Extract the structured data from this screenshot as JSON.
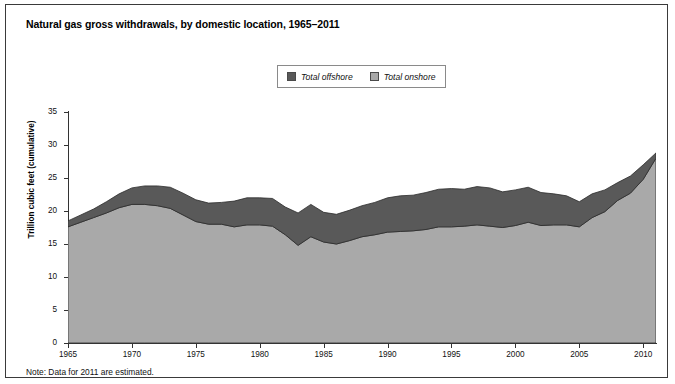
{
  "figure": {
    "title": "Natural gas gross withdrawals, by domestic location, 1965–2011",
    "note": "Note: Data for 2011 are estimated."
  },
  "legend": {
    "items": [
      {
        "label": "Total offshore",
        "color": "#595959",
        "swatch_name": "legend-swatch-offshore"
      },
      {
        "label": "Total onshore",
        "color": "#a9a9a9",
        "swatch_name": "legend-swatch-onshore"
      }
    ]
  },
  "axes": {
    "ylabel": "Trillion cubic feet (cumulative)",
    "yticks": [
      "0",
      "5",
      "10",
      "15",
      "20",
      "25",
      "30",
      "35"
    ],
    "xticks": [
      "1965",
      "1970",
      "1975",
      "1980",
      "1985",
      "1990",
      "1995",
      "2000",
      "2005",
      "2010"
    ]
  },
  "chart_data": {
    "type": "area",
    "stacked": true,
    "title": "Natural gas gross withdrawals, by domestic location, 1965–2011",
    "xlabel": "",
    "ylabel": "Trillion cubic feet (cumulative)",
    "xlim": [
      1965,
      2011
    ],
    "ylim": [
      0,
      35
    ],
    "ytick_step": 5,
    "xtick_step": 5,
    "grid": false,
    "legend_position": "top-center",
    "annotations": [
      "Note: Data for 2011 are estimated."
    ],
    "x": [
      1965,
      1966,
      1967,
      1968,
      1969,
      1970,
      1971,
      1972,
      1973,
      1974,
      1975,
      1976,
      1977,
      1978,
      1979,
      1980,
      1981,
      1982,
      1983,
      1984,
      1985,
      1986,
      1987,
      1988,
      1989,
      1990,
      1991,
      1992,
      1993,
      1994,
      1995,
      1996,
      1997,
      1998,
      1999,
      2000,
      2001,
      2002,
      2003,
      2004,
      2005,
      2006,
      2007,
      2008,
      2009,
      2010,
      2011
    ],
    "series": [
      {
        "name": "Total onshore",
        "color": "#a9a9a9",
        "values": [
          17.6,
          18.3,
          19.0,
          19.7,
          20.5,
          21.0,
          21.0,
          20.8,
          20.4,
          19.4,
          18.4,
          18.0,
          18.0,
          17.6,
          17.9,
          17.9,
          17.7,
          16.4,
          14.8,
          16.1,
          15.3,
          15.0,
          15.5,
          16.1,
          16.4,
          16.8,
          16.9,
          17.0,
          17.2,
          17.6,
          17.6,
          17.7,
          17.9,
          17.7,
          17.5,
          17.8,
          18.3,
          17.8,
          17.9,
          17.9,
          17.6,
          19.0,
          19.9,
          21.6,
          22.7,
          24.8,
          28.0
        ]
      },
      {
        "name": "Total offshore",
        "color": "#595959",
        "values": [
          0.9,
          1.1,
          1.3,
          1.7,
          2.1,
          2.5,
          2.8,
          3.0,
          3.2,
          3.3,
          3.3,
          3.2,
          3.3,
          3.9,
          4.1,
          4.1,
          4.2,
          4.2,
          4.9,
          4.9,
          4.5,
          4.5,
          4.6,
          4.7,
          4.9,
          5.2,
          5.4,
          5.4,
          5.6,
          5.7,
          5.8,
          5.6,
          5.8,
          5.8,
          5.4,
          5.4,
          5.3,
          5.0,
          4.7,
          4.4,
          3.8,
          3.6,
          3.3,
          2.7,
          2.6,
          2.2,
          0.8
        ]
      }
    ],
    "totals": [
      18.5,
      19.4,
      20.3,
      21.4,
      22.6,
      23.5,
      23.8,
      23.8,
      23.6,
      22.7,
      21.7,
      21.2,
      21.3,
      21.5,
      22.0,
      22.0,
      21.9,
      20.6,
      19.7,
      21.0,
      19.8,
      19.5,
      20.1,
      20.8,
      21.3,
      22.0,
      22.3,
      22.4,
      22.8,
      23.3,
      23.4,
      23.3,
      23.7,
      23.5,
      22.9,
      23.2,
      23.6,
      22.8,
      22.6,
      22.3,
      21.4,
      22.6,
      23.2,
      24.3,
      25.3,
      27.0,
      28.8
    ]
  }
}
